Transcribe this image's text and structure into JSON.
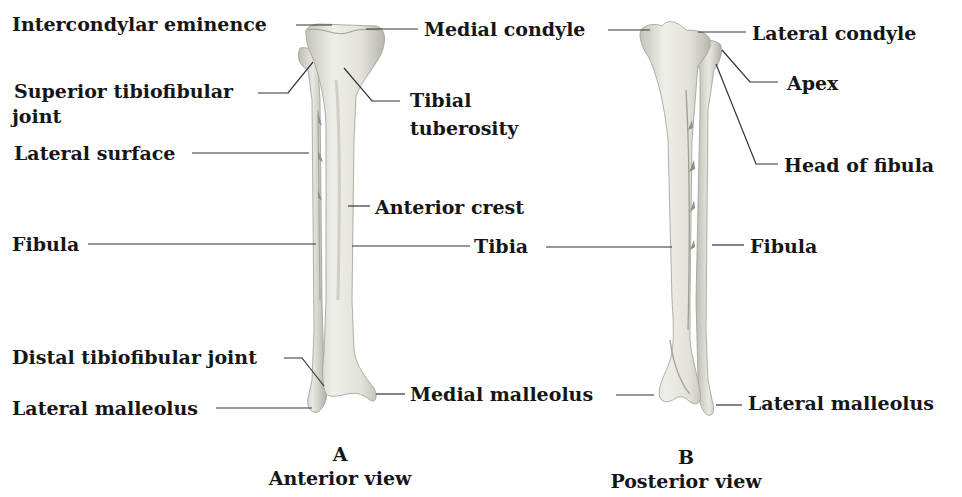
{
  "figure": {
    "views": [
      {
        "letter": "A",
        "title": "Anterior view"
      },
      {
        "letter": "B",
        "title": "Posterior view"
      }
    ],
    "anterior_labels": {
      "intercondylar_eminence": "Intercondylar eminence",
      "medial_condyle": "Medial condyle",
      "superior_tibiofibular_joint_1": "Superior tibiofibular",
      "superior_tibiofibular_joint_2": "joint",
      "tibial_tuberosity_1": "Tibial",
      "tibial_tuberosity_2": "tuberosity",
      "lateral_surface": "Lateral surface",
      "anterior_crest": "Anterior crest",
      "fibula": "Fibula",
      "tibia": "Tibia",
      "distal_tibiofibular_joint": "Distal tibiofibular joint",
      "lateral_malleolus": "Lateral malleolus",
      "medial_malleolus": "Medial malleolus"
    },
    "posterior_labels": {
      "lateral_condyle": "Lateral condyle",
      "apex": "Apex",
      "head_of_fibula": "Head of fibula",
      "fibula": "Fibula",
      "lateral_malleolus": "Lateral malleolus"
    },
    "colors": {
      "bone_fill": "#e6e6df",
      "bone_shadow": "#b9b9b0",
      "leader_line": "#333333",
      "text": "#161616"
    }
  }
}
